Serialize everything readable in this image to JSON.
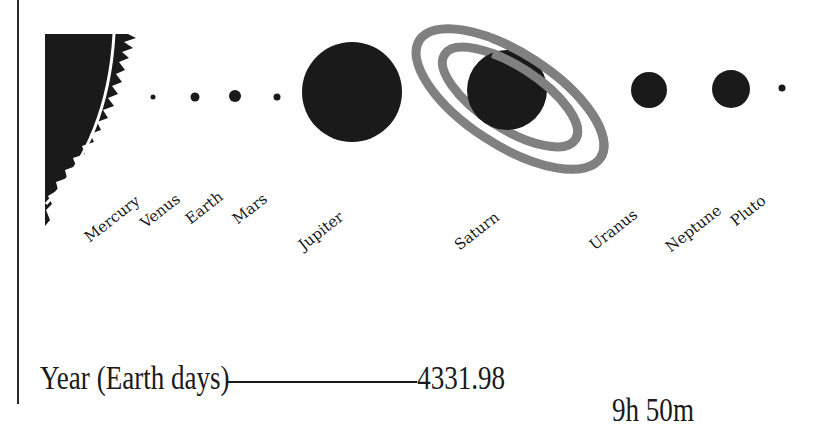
{
  "diagram": {
    "title": "",
    "colors": {
      "planet": "#1a1a1a",
      "ring": "#808080",
      "sun": "#1a1a1a",
      "background": "#ffffff"
    },
    "sun": {
      "name": "sun-edge"
    },
    "planets": [
      {
        "name": "Mercury",
        "cx": 153,
        "cy": 97,
        "r": 2.5
      },
      {
        "name": "Venus",
        "cx": 195,
        "cy": 97,
        "r": 4.5
      },
      {
        "name": "Earth",
        "cx": 235,
        "cy": 96,
        "r": 6
      },
      {
        "name": "Mars",
        "cx": 277,
        "cy": 97,
        "r": 3.5
      },
      {
        "name": "Jupiter",
        "cx": 352,
        "cy": 92,
        "r": 50
      },
      {
        "name": "Saturn",
        "cx": 507,
        "cy": 90,
        "r": 40
      },
      {
        "name": "Uranus",
        "cx": 649,
        "cy": 90,
        "r": 18
      },
      {
        "name": "Neptune",
        "cx": 731,
        "cy": 89,
        "r": 19
      },
      {
        "name": "Pluto",
        "cx": 782,
        "cy": 88,
        "r": 3.5
      }
    ]
  },
  "stats": {
    "rows": [
      {
        "label": "Year (Earth days)",
        "value": "4331.98"
      }
    ],
    "partial_next_value": "9h 50m"
  }
}
